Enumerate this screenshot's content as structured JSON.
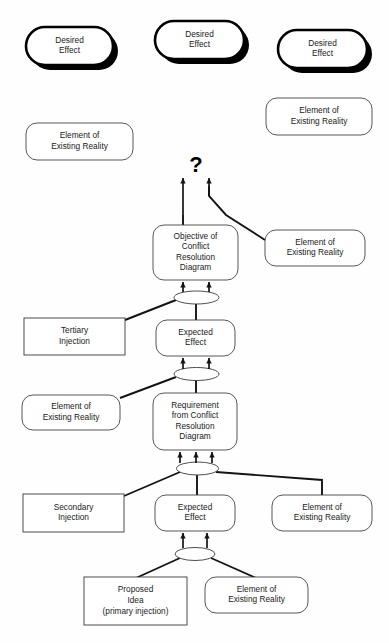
{
  "diagram": {
    "question_mark": "?",
    "label_desired_effect": "Desired\nEffect",
    "label_element_reality": "Element of\nExisting Reality",
    "label_expected_effect": "Expected\nEffect",
    "nodes": [
      {
        "id": "desired-effect-1",
        "name": "desired-effect-box-left",
        "kind": "desired-effect",
        "lines": [
          "Desired",
          "Effect"
        ],
        "x": 26,
        "y": 27,
        "w": 87,
        "h": 38
      },
      {
        "id": "desired-effect-2",
        "name": "desired-effect-box-center",
        "kind": "desired-effect",
        "lines": [
          "Desired",
          "Effect"
        ],
        "x": 155,
        "y": 21,
        "w": 89,
        "h": 38
      },
      {
        "id": "desired-effect-3",
        "name": "desired-effect-box-right",
        "kind": "desired-effect",
        "lines": [
          "Desired",
          "Effect"
        ],
        "x": 278,
        "y": 30,
        "w": 89,
        "h": 38
      },
      {
        "id": "reality-top-right",
        "name": "element-of-existing-reality-top-right",
        "kind": "reality",
        "lines": [
          "Element of",
          "Existing Reality"
        ],
        "x": 266,
        "y": 98,
        "w": 106,
        "h": 37
      },
      {
        "id": "reality-top-left",
        "name": "element-of-existing-reality-top-left",
        "kind": "reality",
        "lines": [
          "Element of",
          "Existing Reality"
        ],
        "x": 26,
        "y": 123,
        "w": 107,
        "h": 37
      },
      {
        "id": "objective-crd",
        "name": "objective-of-conflict-resolution-diagram",
        "kind": "reality",
        "lines": [
          "Objective of",
          "Conflict",
          "Resolution",
          "Diagram"
        ],
        "x": 153,
        "y": 225,
        "w": 85,
        "h": 55
      },
      {
        "id": "reality-mid-right",
        "name": "element-of-existing-reality-mid-right",
        "kind": "reality",
        "lines": [
          "Element of",
          "Existing Reality"
        ],
        "x": 265,
        "y": 230,
        "w": 100,
        "h": 36
      },
      {
        "id": "tertiary-injection",
        "name": "tertiary-injection-box",
        "kind": "rect",
        "lines": [
          "Tertiary",
          "Injection"
        ],
        "x": 24,
        "y": 318,
        "w": 101,
        "h": 37
      },
      {
        "id": "expected-effect-upper",
        "name": "expected-effect-box-upper",
        "kind": "reality",
        "lines": [
          "Expected",
          "Effect"
        ],
        "x": 156,
        "y": 320,
        "w": 79,
        "h": 36
      },
      {
        "id": "reality-mid-left",
        "name": "element-of-existing-reality-mid-left",
        "kind": "reality",
        "lines": [
          "Element of",
          "Existing Reality"
        ],
        "x": 22,
        "y": 395,
        "w": 98,
        "h": 35
      },
      {
        "id": "requirement-crd",
        "name": "requirement-from-conflict-resolution-diagram",
        "kind": "reality",
        "lines": [
          "Requirement",
          "from Conflict",
          "Resolution",
          "Diagram"
        ],
        "x": 153,
        "y": 393,
        "w": 84,
        "h": 57
      },
      {
        "id": "secondary-injection",
        "name": "secondary-injection-box",
        "kind": "rect",
        "lines": [
          "Secondary",
          "Injection"
        ],
        "x": 23,
        "y": 494,
        "w": 101,
        "h": 38
      },
      {
        "id": "expected-effect-lower",
        "name": "expected-effect-box-lower",
        "kind": "reality",
        "lines": [
          "Expected",
          "Effect"
        ],
        "x": 155,
        "y": 495,
        "w": 80,
        "h": 36
      },
      {
        "id": "reality-low-right",
        "name": "element-of-existing-reality-low-right",
        "kind": "reality",
        "lines": [
          "Element of",
          "Existing Reality"
        ],
        "x": 272,
        "y": 495,
        "w": 100,
        "h": 36
      },
      {
        "id": "proposed-idea",
        "name": "proposed-idea-primary-injection-box",
        "kind": "rect",
        "lines": [
          "Proposed",
          "Idea",
          "(primary injection)"
        ],
        "x": 84,
        "y": 577,
        "w": 103,
        "h": 48
      },
      {
        "id": "reality-bottom",
        "name": "element-of-existing-reality-bottom",
        "kind": "reality",
        "lines": [
          "Element of",
          "Existing Reality"
        ],
        "x": 205,
        "y": 577,
        "w": 103,
        "h": 36
      }
    ],
    "connectors": [
      {
        "id": "ellipse-1",
        "name": "and-connector-ellipse-1",
        "cx": 196.5,
        "cy": 297.5,
        "rx": 22.5,
        "ry": 6.5
      },
      {
        "id": "ellipse-2",
        "name": "and-connector-ellipse-2",
        "cx": 196.5,
        "cy": 374.0,
        "rx": 22.5,
        "ry": 6.5
      },
      {
        "id": "ellipse-3",
        "name": "and-connector-ellipse-3",
        "cx": 197.5,
        "cy": 468.5,
        "rx": 21.0,
        "ry": 6.5
      },
      {
        "id": "ellipse-4",
        "name": "and-connector-ellipse-4",
        "cx": 195.0,
        "cy": 554.0,
        "rx": 20.0,
        "ry": 6.5
      }
    ],
    "arrows": [
      {
        "name": "arrow-up-to-unknown-left",
        "x1": 183,
        "y1": 215,
        "x2": 183,
        "y2": 178
      },
      {
        "name": "arrow-up-to-unknown-right",
        "x1": 209,
        "y1": 196,
        "x2": 209,
        "y2": 178
      },
      {
        "name": "arrow-into-objective-left",
        "x1": 183,
        "y1": 292,
        "x2": 183,
        "y2": 282
      },
      {
        "name": "arrow-into-objective-right",
        "x1": 209,
        "y1": 292,
        "x2": 209,
        "y2": 282
      },
      {
        "name": "arrow-into-expected-upper-left",
        "x1": 183,
        "y1": 369,
        "x2": 183,
        "y2": 358
      },
      {
        "name": "arrow-into-expected-upper-right",
        "x1": 209,
        "y1": 369,
        "x2": 209,
        "y2": 358
      },
      {
        "name": "arrow-into-requirement-left",
        "x1": 180,
        "y1": 463,
        "x2": 180,
        "y2": 452
      },
      {
        "name": "arrow-into-requirement-center",
        "x1": 196,
        "y1": 463,
        "x2": 196,
        "y2": 452
      },
      {
        "name": "arrow-into-requirement-right",
        "x1": 212,
        "y1": 463,
        "x2": 212,
        "y2": 452
      },
      {
        "name": "arrow-into-expected-lower-left",
        "x1": 183,
        "y1": 548,
        "x2": 183,
        "y2": 533
      },
      {
        "name": "arrow-into-expected-lower-right",
        "x1": 207,
        "y1": 548,
        "x2": 207,
        "y2": 533
      }
    ],
    "links": [
      {
        "name": "link-reality-midright-to-unknown",
        "points": "209,196 209,186 209,196 226,215 265,240"
      },
      {
        "name": "link-objective-vertical",
        "points": "183,215 183,226"
      },
      {
        "name": "link-ellipse1-to-tertiary",
        "points": "176,300 125,320"
      },
      {
        "name": "link-ellipse1-to-expected-upper",
        "points": "196,302 196,320"
      },
      {
        "name": "link-ellipse2-to-realitymidleft",
        "points": "176,377 120,398"
      },
      {
        "name": "link-ellipse2-to-requirement",
        "points": "196,379 196,394"
      },
      {
        "name": "link-ellipse3-to-secondary",
        "points": "180,472 124,496"
      },
      {
        "name": "link-ellipse3-to-expected-lower",
        "points": "197,474 197,496"
      },
      {
        "name": "link-ellipse3-to-realitylowright",
        "points": "216,472 322,480 322,495"
      },
      {
        "name": "link-ellipse4-to-proposed",
        "points": "180,558 136,578"
      },
      {
        "name": "link-ellipse4-to-realitybottom",
        "points": "211,558 256,578"
      }
    ],
    "question": {
      "x": 196,
      "y": 172
    }
  }
}
